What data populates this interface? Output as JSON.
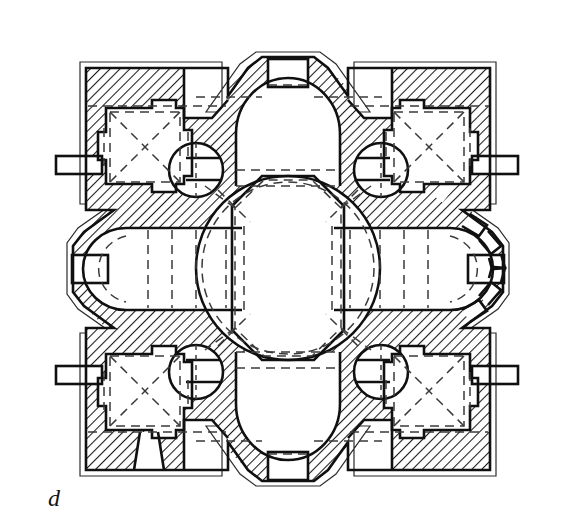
{
  "figure": {
    "label": "d",
    "caption_letter": "d",
    "type": "architectural-floor-plan",
    "orientation": "north at top",
    "colors": {
      "background": "#ffffff",
      "ink": "#121212",
      "wall_hatch_line": "#1a1a1a",
      "wall_hatch_fill": "#ffffff",
      "dashed_line": "#3a3a3a",
      "outline_thin": "#2a2a2a"
    },
    "line_styles": {
      "wall_cut": "solid heavy outline with 45-degree diagonal hatching",
      "vault_projection": "dashed",
      "exterior_eave_outline": "thin solid double line"
    },
    "drawing_bounds": {
      "left": 52,
      "top": 55,
      "right": 523,
      "bottom": 482
    }
  },
  "plan_elements": {
    "central_space": {
      "name": "central domed bay",
      "shape": "circle inscribed in octagon",
      "center_x": 288,
      "center_y": 268,
      "dome_radius": 86,
      "drum_radius": 96,
      "notes": "dashed circle = dome springing; dashed octagon = supporting arches"
    },
    "arms": [
      {
        "name": "north-apse",
        "direction": "north",
        "shape": "semicircular conch with window",
        "window": "rectangular opening at apex"
      },
      {
        "name": "south-apse",
        "direction": "south",
        "shape": "semicircular conch with window",
        "window": "rectangular opening at apex"
      },
      {
        "name": "west-arm",
        "direction": "west",
        "shape": "barrel-vaulted bay ending in semicircular apse",
        "window": "splayed opening on axis"
      },
      {
        "name": "east-arm",
        "direction": "east",
        "shape": "barrel-vaulted bay ending in apse with radiating buttresses",
        "window": "faceted exterior with wedge niches"
      }
    ],
    "corner_chapels": [
      {
        "name": "northwest-chapel",
        "vault": "cross-vault",
        "marking": "dashed diagonals forming X"
      },
      {
        "name": "northeast-chapel",
        "vault": "cross-vault",
        "marking": "dashed diagonals forming X"
      },
      {
        "name": "southwest-chapel",
        "vault": "cross-vault",
        "marking": "dashed diagonals forming X",
        "extra": "splayed window embrasure on south wall"
      },
      {
        "name": "southeast-chapel",
        "vault": "cross-vault",
        "marking": "dashed diagonals forming X"
      }
    ],
    "circular_piers": [
      {
        "name": "northwest-round-chamber",
        "cx": 196,
        "cy": 170,
        "r": 26
      },
      {
        "name": "northeast-round-chamber",
        "cx": 381,
        "cy": 170,
        "r": 26
      },
      {
        "name": "southwest-round-chamber",
        "cx": 196,
        "cy": 372,
        "r": 26
      },
      {
        "name": "southeast-round-chamber",
        "cx": 381,
        "cy": 372,
        "r": 26
      }
    ],
    "exterior": {
      "plan_shape": "square block with chamfered corners and four projecting apses",
      "corner_treatment": "re-entrant chamfer at each corner of outer wall"
    }
  }
}
